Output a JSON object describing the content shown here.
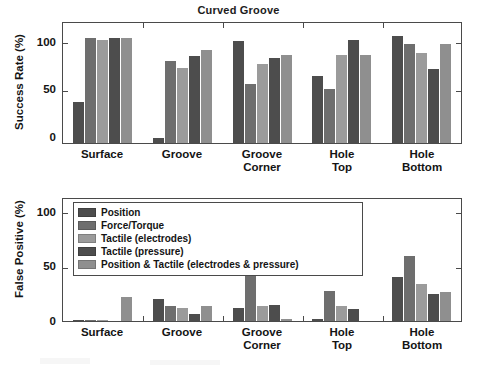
{
  "figure": {
    "title": "Curved Groove",
    "background": "#ffffff",
    "series_colors": [
      "#4d4d4d",
      "#6e6e6e",
      "#9b9b9b",
      "#4d4d4d",
      "#8f8f8f"
    ],
    "axis_color": "#4a4a4a"
  },
  "legend": {
    "position": "upper-left-of-lower-panel",
    "entries": [
      {
        "label": "Position",
        "color": "#4d4d4d"
      },
      {
        "label": "Force/Torque",
        "color": "#6e6e6e"
      },
      {
        "label": "Tactile (electrodes)",
        "color": "#9b9b9b"
      },
      {
        "label": "Tactile (pressure)",
        "color": "#4d4d4d"
      },
      {
        "label": "Position & Tactile (electrodes & pressure)",
        "color": "#8f8f8f"
      }
    ]
  },
  "chart_data": [
    {
      "type": "bar",
      "title": "Curved Groove",
      "xlabel": "",
      "ylabel": "Success Rate (%)",
      "ylim": [
        0,
        112
      ],
      "yticks": [
        0,
        50,
        100
      ],
      "ytick_labels": [
        "0",
        "50",
        "100"
      ],
      "grid": false,
      "legend": "none",
      "categories": [
        "Surface",
        "Groove",
        "Groove Corner",
        "Hole Top",
        "Hole Bottom"
      ],
      "category_lines": [
        [
          "Surface"
        ],
        [
          "Groove"
        ],
        [
          "Groove",
          "Corner"
        ],
        [
          "Hole",
          "Top"
        ],
        [
          "Hole",
          "Bottom"
        ]
      ],
      "series": [
        {
          "name": "Position",
          "color": "#4d4d4d",
          "values": [
            38,
            5,
            95,
            63,
            100
          ]
        },
        {
          "name": "Force/Torque",
          "color": "#6e6e6e",
          "values": [
            98,
            77,
            55,
            50,
            92
          ]
        },
        {
          "name": "Tactile (electrodes)",
          "color": "#9b9b9b",
          "values": [
            96,
            70,
            74,
            82,
            84
          ]
        },
        {
          "name": "Tactile (pressure)",
          "color": "#4d4d4d",
          "values": [
            98,
            81,
            79,
            96,
            69
          ]
        },
        {
          "name": "Position & Tactile (electrodes & pressure)",
          "color": "#8f8f8f",
          "values": [
            98,
            87,
            82,
            82,
            92
          ]
        }
      ]
    },
    {
      "type": "bar",
      "title": "",
      "xlabel": "",
      "ylabel": "False Positive (%)",
      "ylim": [
        0,
        112
      ],
      "yticks": [
        0,
        50,
        100
      ],
      "ytick_labels": [
        "0",
        "50",
        "100"
      ],
      "grid": false,
      "legend": "upper-left",
      "categories": [
        "Surface",
        "Groove",
        "Groove Corner",
        "Hole Top",
        "Hole Bottom"
      ],
      "category_lines": [
        [
          "Surface"
        ],
        [
          "Groove"
        ],
        [
          "Groove",
          "Corner"
        ],
        [
          "Hole",
          "Top"
        ],
        [
          "Hole",
          "Bottom"
        ]
      ],
      "series": [
        {
          "name": "Position",
          "color": "#4d4d4d",
          "values": [
            1,
            20,
            12,
            2,
            40
          ]
        },
        {
          "name": "Force/Torque",
          "color": "#6e6e6e",
          "values": [
            1,
            14,
            49,
            28,
            60
          ]
        },
        {
          "name": "Tactile (electrodes)",
          "color": "#9b9b9b",
          "values": [
            1,
            12,
            14,
            14,
            34
          ]
        },
        {
          "name": "Tactile (pressure)",
          "color": "#4d4d4d",
          "values": [
            0,
            6,
            15,
            11,
            25
          ]
        },
        {
          "name": "Position & Tactile (electrodes & pressure)",
          "color": "#8f8f8f",
          "values": [
            22,
            14,
            2,
            0,
            27
          ]
        }
      ]
    }
  ]
}
